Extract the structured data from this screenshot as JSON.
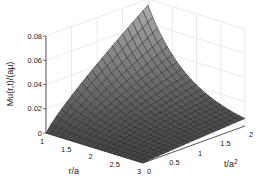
{
  "chart_data": {
    "type": "surface3d",
    "title": "",
    "xlabel": "r/a",
    "ylabel": "t/a^2",
    "zlabel": "Mu(r,t)/(aμ)",
    "x_range": [
      1,
      3
    ],
    "y_range": [
      0,
      2
    ],
    "z_range": [
      0,
      0.08
    ],
    "x_ticks": [
      "1",
      "1.5",
      "2",
      "2.5",
      "3"
    ],
    "y_ticks": [
      "0",
      "0.5",
      "1",
      "1.5",
      "2"
    ],
    "z_ticks": [
      "0",
      "0.02",
      "0.04",
      "0.06",
      "0.08"
    ],
    "grid": true,
    "colormap": "gray",
    "mesh": {
      "nr": 20,
      "nt": 20
    },
    "surface_samples": [
      {
        "r": 1,
        "t": 0,
        "z": 0
      },
      {
        "r": 3,
        "t": 0,
        "z": 0
      },
      {
        "r": 1,
        "t": 2,
        "z": 0.075
      },
      {
        "r": 3,
        "t": 2,
        "z": 0.006
      },
      {
        "r": 2,
        "t": 1,
        "z": 0.018
      }
    ]
  }
}
